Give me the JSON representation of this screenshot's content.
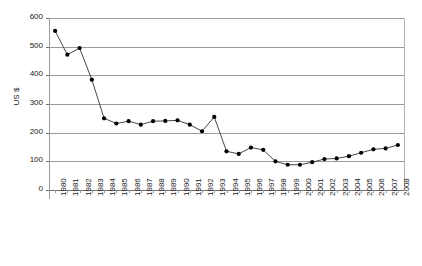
{
  "chart_data": {
    "type": "line",
    "title": "",
    "xlabel": "",
    "ylabel": "US $",
    "ylim": [
      0,
      600
    ],
    "ytick_step": 100,
    "yticks": [
      0,
      100,
      200,
      300,
      400,
      500,
      600
    ],
    "grid": "horizontal",
    "legend": "none",
    "marker": "filled-circle",
    "line_color": "#333333",
    "marker_color": "#000000",
    "grid_color": "#9a9a9a",
    "categories": [
      "1980",
      "1981",
      "1982",
      "1983",
      "1984",
      "1985",
      "1986",
      "1987",
      "1988",
      "1989",
      "1990",
      "1991",
      "1992",
      "1993",
      "1994",
      "1995",
      "1996",
      "1997",
      "1998",
      "1999",
      "2000",
      "2001",
      "2002",
      "2003",
      "2004",
      "2005",
      "2006",
      "2007",
      "2008"
    ],
    "values": [
      555,
      472,
      495,
      385,
      250,
      232,
      240,
      228,
      240,
      241,
      243,
      228,
      205,
      255,
      135,
      126,
      148,
      140,
      100,
      88,
      88,
      97,
      108,
      110,
      118,
      130,
      142,
      145,
      157
    ]
  }
}
